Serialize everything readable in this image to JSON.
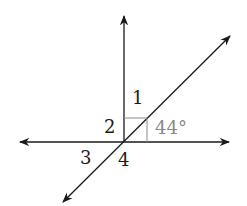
{
  "diagram": {
    "labels": {
      "angle1": "1",
      "angle2": "2",
      "angle3": "3",
      "angle4": "4",
      "given_angle": "44°"
    },
    "colors": {
      "line": "#1a1a1a",
      "label": "#1a1a1a",
      "given_label": "#8a8a8a",
      "right_angle_box": "#8a8a8a"
    }
  }
}
